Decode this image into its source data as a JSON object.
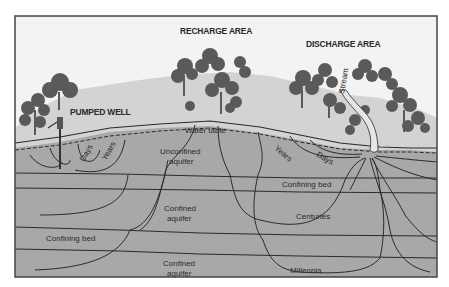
{
  "diagram": {
    "title_labels": {
      "recharge_area": "RECHARGE AREA",
      "discharge_area": "DISCHARGE AREA",
      "pumped_well": "PUMPED WELL",
      "stream": "Stream",
      "water_table": "Water table"
    },
    "layers": {
      "unconfined_aquifer_line1": "Unconfined",
      "unconfined_aquifer_line2": "aquifer",
      "confining_bed_upper": "Confining bed",
      "confined_aquifer_upper_line1": "Confined",
      "confined_aquifer_upper_line2": "aquifer",
      "confining_bed_lower": "Confining bed",
      "confined_aquifer_lower_line1": "Confined",
      "confined_aquifer_lower_line2": "aquifer"
    },
    "flow_times": {
      "well_days": "Days",
      "well_years": "Years",
      "stream_years": "Years",
      "stream_days": "Days",
      "centuries": "Centuries",
      "millennia": "Millennia"
    },
    "colors": {
      "sky": "#f2f2f2",
      "land_surface": "#d4d4d4",
      "unsaturated": "#cfcfcf",
      "aquifer": "#a9a9a9",
      "lines": "#2b2b2b",
      "trees": "#5e5e5e",
      "frame": "#444444"
    }
  }
}
